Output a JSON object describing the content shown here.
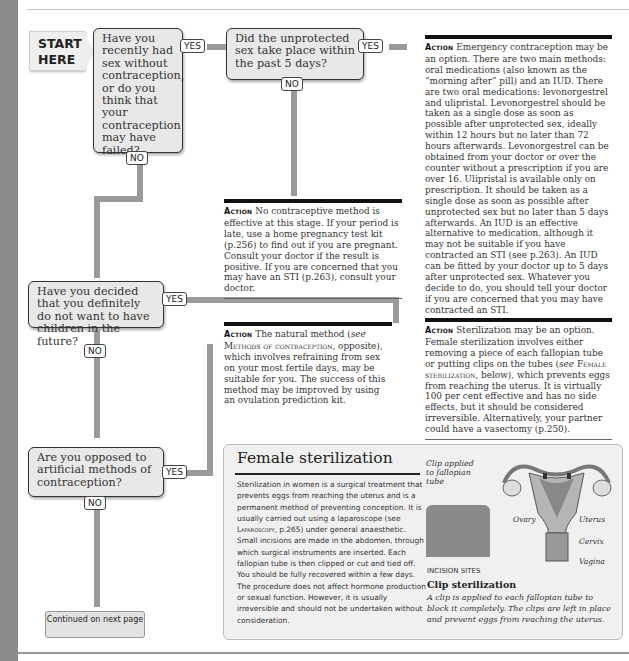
{
  "flowchart": {
    "start_label": "START HERE",
    "questions": [
      {
        "id": "q1",
        "text": "Have you recently had sex without contraception, or do you think that your contraception may have failed?",
        "yes": "YES",
        "no": "NO"
      },
      {
        "id": "q2",
        "text": "Did the unprotected sex take place within the past 5 days?",
        "yes": "YES",
        "no": "NO"
      },
      {
        "id": "q3",
        "text": "Have you decided that you definitely do not want to have children in the future?",
        "yes": "YES",
        "no": "NO"
      },
      {
        "id": "q4",
        "text": "Are you opposed to artificial methods of contraception?",
        "yes": "YES",
        "no": "NO"
      }
    ],
    "actions": [
      {
        "id": "emergency",
        "label": "Action",
        "text": "Emergency contraception may be an option. There are two main methods: oral medications (also known as the “morning after” pill) and an IUD. There are two oral medications: levonorgestrel and ulipristal. Levonorgestrel should be taken as a single dose as soon as possible after unprotected sex, ideally within 12 hours but no later than 72 hours afterwards. Levonorgestrel can be obtained from your doctor or over the counter without a prescription if you are over 16. Ulipristal is available only on prescription. It should be taken as a single dose as soon as possible after unprotected sex but no later than 5 days afterwards. An IUD is an effective alternative to medication, although it may not be suitable if you have contracted an STI (see p.263). An IUD can be fitted by your doctor up to 5 days after unprotected sex. Whatever you decide to do, you should tell your doctor if you are concerned that you may have contracted an STI."
      },
      {
        "id": "no-method",
        "label": "Action",
        "text": "No contraceptive method is effective at this stage. If your period is late, use a home pregnancy test kit (p.256) to find out if you are pregnant. Consult your doctor if the result is positive. If you are concerned that you may have an STI (p.263), consult your doctor."
      },
      {
        "id": "natural",
        "label": "Action",
        "text_pre": "The natural method (",
        "text_see": "see",
        "text_ref": "Methods of contraception",
        "text_post": ", opposite), which involves refraining from sex on your most fertile days, may be suitable for you. The success of this method may be improved by using an ovulation prediction kit."
      },
      {
        "id": "sterilization",
        "label": "Action",
        "text_pre": "Sterilization may be an option. Female sterilization involves either removing a piece of each fallopian tube or putting clips on the tubes (",
        "text_see": "see",
        "text_ref": "Female sterilization",
        "text_post": ", below), which prevents eggs from reaching the uterus. It is virtually 100 per cent effective and has no side effects, but it should be considered irreversible. Alternatively, your partner could have a vasectomy (p.250)."
      }
    ],
    "continued": "Continued on next page"
  },
  "panel": {
    "title": "Female sterilization",
    "body_pre": "Sterilization in women is a surgical treatment that prevents eggs from reaching the uterus and is a permanent method of preventing conception. It is usually carried out using a laparoscope (see ",
    "body_ref": "Laparoscopy",
    "body_post": ", p.265) under general anaesthetic. Small incisions are made in the abdomen, through which surgical instruments are inserted. Each fallopian tube is then clipped or cut and tied off. You should be fully recovered within a few days. The procedure does not affect hormone production or sexual function. However, it is usually irreversible and should not be undertaken without consideration.",
    "illustration": {
      "clip_caption": "Clip applied to fallopian tube",
      "labels": {
        "ovary": "Ovary",
        "uterus": "Uterus",
        "cervix": "Cervix",
        "vagina": "Vagina"
      },
      "incision_label": "INCISION SITES"
    },
    "clip_title": "Clip sterilization",
    "clip_desc": "A clip is applied to each fallopian tube to block it completely. The clips are left in place and prevent eggs from reaching the uterus."
  },
  "colors": {
    "connector": "#9a9a9a",
    "box_fill": "#e8e8e8",
    "strip": "#8c8c8c"
  }
}
